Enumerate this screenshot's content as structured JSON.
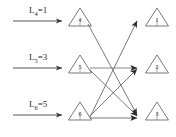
{
  "figure": {
    "type": "bipartite-flow-diagram",
    "background": "#ffffff",
    "stroke_color": "#555555",
    "text_color": "#2b2b2b",
    "width": 176,
    "height": 137
  },
  "arrival_labels": [
    {
      "name": "L4",
      "base": "L",
      "subscript": "4",
      "equals": "=",
      "value": "1",
      "text": "L4=1"
    },
    {
      "name": "L5",
      "base": "L",
      "subscript": "5",
      "equals": "=",
      "value": "3",
      "text": "L5=3"
    },
    {
      "name": "L6",
      "base": "L",
      "subscript": "6",
      "equals": "=",
      "value": "5",
      "text": "L6=5"
    }
  ],
  "left_nodes": [
    {
      "id": "4",
      "label": "4"
    },
    {
      "id": "5",
      "label": "5"
    },
    {
      "id": "6",
      "label": "6"
    }
  ],
  "right_nodes": [
    {
      "id": "1",
      "label": "1"
    },
    {
      "id": "2",
      "label": "2"
    },
    {
      "id": "3",
      "label": "3"
    }
  ],
  "input_arrows": [
    {
      "from_label": "L4",
      "to_node": "4"
    },
    {
      "from_label": "L5",
      "to_node": "5"
    },
    {
      "from_label": "L6",
      "to_node": "6"
    }
  ],
  "edges": [
    {
      "from": "4",
      "to": "3"
    },
    {
      "from": "5",
      "to": "2"
    },
    {
      "from": "5",
      "to": "3"
    },
    {
      "from": "6",
      "to": "1"
    },
    {
      "from": "6",
      "to": "2"
    },
    {
      "from": "6",
      "to": "3"
    }
  ]
}
